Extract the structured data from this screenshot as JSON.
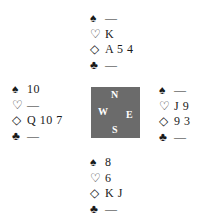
{
  "compass": {
    "north": "N",
    "south": "S",
    "east": "E",
    "west": "W",
    "color": "#6b6b6b"
  },
  "symbols": {
    "spades": "♠",
    "hearts": "♡",
    "diamonds": "◇",
    "clubs": "♣"
  },
  "hands": {
    "north": {
      "spades": "—",
      "hearts": "K",
      "diamonds": "A 5 4",
      "clubs": "—"
    },
    "west": {
      "spades": "10",
      "hearts": "—",
      "diamonds": "Q 10 7",
      "clubs": "—"
    },
    "east": {
      "spades": "—",
      "hearts": "J 9",
      "diamonds": "9 3",
      "clubs": "—"
    },
    "south": {
      "spades": "8",
      "hearts": "6",
      "diamonds": "K J",
      "clubs": "—"
    }
  }
}
